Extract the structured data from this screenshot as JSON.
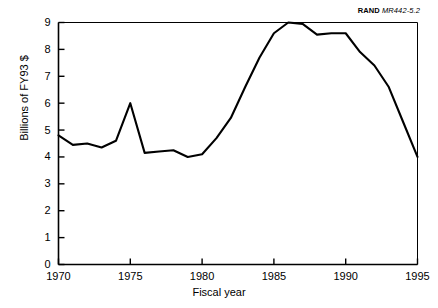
{
  "figure": {
    "source_note_brand": "RAND",
    "source_note_code": "MR442-5.2"
  },
  "chart_data": {
    "type": "line",
    "title": "",
    "subtitle": "",
    "xlabel": "Fiscal year",
    "ylabel": "Billions of FY93 $",
    "xlim": [
      1970,
      1995
    ],
    "ylim": [
      0,
      9
    ],
    "xticks": [
      1970,
      1975,
      1980,
      1985,
      1990,
      1995
    ],
    "xtick_labels": [
      "1970",
      "1975",
      "1980",
      "1985",
      "1990",
      "1995"
    ],
    "yticks": [
      0,
      1,
      2,
      3,
      4,
      5,
      6,
      7,
      8,
      9
    ],
    "ytick_labels": [
      "0",
      "1",
      "2",
      "3",
      "4",
      "5",
      "6",
      "7",
      "8",
      "9"
    ],
    "grid": false,
    "legend": null,
    "series": [
      {
        "name": "Funding",
        "x": [
          1970,
          1971,
          1972,
          1973,
          1974,
          1975,
          1976,
          1977,
          1978,
          1979,
          1980,
          1981,
          1982,
          1983,
          1984,
          1985,
          1986,
          1987,
          1988,
          1989,
          1990,
          1991,
          1992,
          1993,
          1994,
          1995
        ],
        "values": [
          4.8,
          4.45,
          4.5,
          4.35,
          4.6,
          6.0,
          4.15,
          4.2,
          4.25,
          4.0,
          4.1,
          4.7,
          5.45,
          6.6,
          7.7,
          8.6,
          9.0,
          8.95,
          8.55,
          8.6,
          8.6,
          7.9,
          7.4,
          6.6,
          5.3,
          4.0
        ]
      }
    ]
  }
}
